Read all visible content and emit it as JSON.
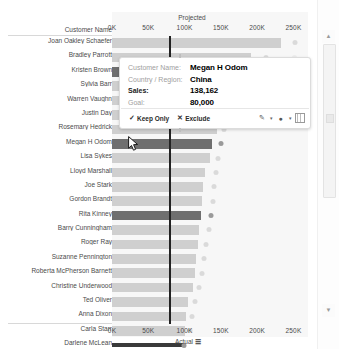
{
  "chart_data": {
    "type": "bar",
    "title": "",
    "xlabel": "Actual",
    "ylabel": "Customer Name",
    "top_axis_label": "Projected",
    "bottom_axis_label": "Actual",
    "axis_row_header": "Customer Name",
    "xlim": [
      0,
      270000
    ],
    "ticks": [
      "0K",
      "50K",
      "100K",
      "150K",
      "200K",
      "250K"
    ],
    "tick_values": [
      0,
      50000,
      100000,
      150000,
      200000,
      250000
    ],
    "grid": false,
    "legend": "none",
    "reference_line_value": 80000,
    "categories": [
      "Joan Oakley Schaefer",
      "Bradley Parrott",
      "Kristen Brown",
      "Sylvia Barr",
      "Warren Vaughn",
      "Justin Day",
      "Rosemary Hedrick",
      "Megan H Odom",
      "Lisa Sykes",
      "Lloyd Marshall",
      "Joe Stark",
      "Gordon Brandt",
      "Rita Kinney",
      "Barry Cunningham",
      "Roger Ray",
      "Suzanne Pennington",
      "Roberta McPherson Barnett",
      "Christine Underwood",
      "Ted Oliver",
      "Anna Dixon",
      "Carla Starr",
      "Darlene McLean"
    ],
    "series": [
      {
        "name": "Actual",
        "values": [
          233000,
          192000,
          152000,
          150000,
          148000,
          146000,
          144000,
          138162,
          135000,
          128000,
          126000,
          124000,
          122000,
          120000,
          118000,
          116000,
          114000,
          112000,
          105000,
          102000,
          100000,
          98000
        ]
      },
      {
        "name": "Projected",
        "values": [
          252000,
          212000,
          174000,
          168000,
          160000,
          158000,
          154000,
          150000,
          146000,
          143000,
          141000,
          139000,
          137000,
          134000,
          130000,
          127000,
          124000,
          120000,
          114000,
          110000,
          107000,
          99000
        ]
      }
    ],
    "highlighted_categories": [
      "Kristen Brown",
      "Megan H Odom",
      "Rita Kinney",
      "Darlene McLean"
    ],
    "colors": {
      "bar": "#cfcfcf",
      "bar_highlight": "#6f6f6f",
      "dot": "#dadada",
      "dot_highlight": "#9a9a9a",
      "reference_line": "#222222",
      "plot_background": "#f7f7f7",
      "axis_text": "#4a4a4a"
    }
  },
  "tooltip": {
    "fields": [
      {
        "key": "Customer Name:",
        "value": "Megan H Odom",
        "key_bold": false
      },
      {
        "key": "Country / Region:",
        "value": "China",
        "key_bold": false
      },
      {
        "key": "Sales:",
        "value": "138,162",
        "key_bold": true
      },
      {
        "key": "Goal:",
        "value": "80,000",
        "key_bold": false
      }
    ],
    "keep_only_label": "Keep Only",
    "keep_only_icon": "check-icon",
    "exclude_label": "Exclude",
    "exclude_icon": "cross-icon",
    "icons": [
      {
        "name": "highlight-pencil-icon",
        "glyph": "✐"
      },
      {
        "name": "chevron-down-icon",
        "glyph": "▾"
      },
      {
        "name": "group-members-icon",
        "glyph": "●"
      },
      {
        "name": "chevron-down-icon",
        "glyph": "▾"
      },
      {
        "name": "view-data-grid-icon",
        "glyph": ""
      }
    ]
  },
  "scrollbar": {
    "up_arrow_icon": "chevron-up-icon",
    "down_arrow_icon": "chevron-down-icon",
    "up_glyph": "▲",
    "down_glyph": "▼"
  },
  "cursor": {
    "icon": "mouse-pointer-icon"
  }
}
